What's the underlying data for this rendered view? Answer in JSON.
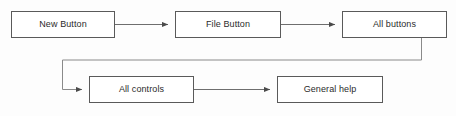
{
  "diagram": {
    "type": "flowchart",
    "canvas": {
      "width": 456,
      "height": 116,
      "background": "#fdfdfd"
    },
    "style": {
      "node_fill": "#ffffff",
      "node_border": "#5a5a5a",
      "connector_color": "#6e6e6e",
      "text_color": "#2b2b2b"
    },
    "nodes": [
      {
        "id": "new-button",
        "label": "New Button",
        "x": 11,
        "y": 11,
        "w": 104,
        "h": 27
      },
      {
        "id": "file-button",
        "label": "File Button",
        "x": 175,
        "y": 11,
        "w": 106,
        "h": 27
      },
      {
        "id": "all-buttons",
        "label": "All buttons",
        "x": 342,
        "y": 11,
        "w": 105,
        "h": 27
      },
      {
        "id": "all-controls",
        "label": "All controls",
        "x": 89,
        "y": 76,
        "w": 105,
        "h": 27
      },
      {
        "id": "general-help",
        "label": "General help",
        "x": 277,
        "y": 76,
        "w": 106,
        "h": 27
      }
    ],
    "connectors": [
      {
        "id": "new-to-file",
        "from": "new-button",
        "to": "file-button",
        "arrow": true
      },
      {
        "id": "file-to-all",
        "from": "file-button",
        "to": "all-buttons",
        "arrow": true
      },
      {
        "id": "all-to-controls",
        "from": "all-buttons",
        "to": "all-controls",
        "arrow": true
      },
      {
        "id": "controls-to-help",
        "from": "all-controls",
        "to": "general-help",
        "arrow": true
      }
    ]
  }
}
